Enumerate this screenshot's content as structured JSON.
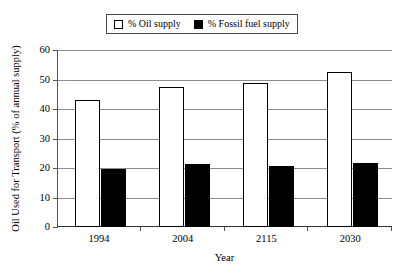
{
  "chart_data": {
    "type": "bar",
    "title": "",
    "subtitle": "",
    "categories": [
      "1994",
      "2004",
      "2115",
      "2030"
    ],
    "series": [
      {
        "name": "% Oil supply",
        "values": [
          43.2,
          47.6,
          48.8,
          52.5
        ],
        "style": "open"
      },
      {
        "name": "% Fossil fuel supply",
        "values": [
          19.7,
          21.2,
          20.7,
          21.7
        ],
        "style": "solid"
      }
    ],
    "xlabel": "Year",
    "ylabel": "Oil Used for Transport (% of annual supply)",
    "ylim": [
      0,
      60
    ],
    "yticks": [
      0,
      10,
      20,
      30,
      40,
      50,
      60
    ],
    "ytick_labels": [
      "0",
      "10",
      "20",
      "30",
      "40",
      "50",
      "60"
    ],
    "grid": true,
    "grid_axis": "y",
    "legend_position": "top-center",
    "colors": {
      "open_fill": "#ffffff",
      "open_edge": "#000000",
      "solid_fill": "#000000",
      "gridline": "#8c8c8c",
      "axis": "#555555",
      "background": "#ffffff",
      "text": "#000000"
    }
  }
}
